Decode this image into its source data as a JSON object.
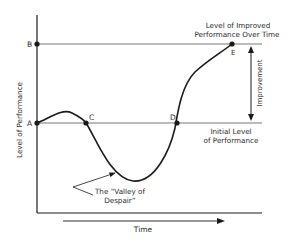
{
  "diagram": {
    "y_axis_label": "Level of Performance",
    "x_axis_label": "Time",
    "points": {
      "A": "A",
      "B": "B",
      "C": "C",
      "D": "D",
      "E": "E"
    },
    "annotations": {
      "improved_line1": "Level of Improved",
      "improved_line2": "Performance Over Time",
      "initial_line1": "Initial Level",
      "initial_line2": "of Performance",
      "improvement": "Improvement",
      "valley_line1": "The “Valley of",
      "valley_line2": "Despair”"
    },
    "colors": {
      "line": "#1a1a1a",
      "reference_line": "#555555",
      "text": "#2a2a2a"
    }
  }
}
